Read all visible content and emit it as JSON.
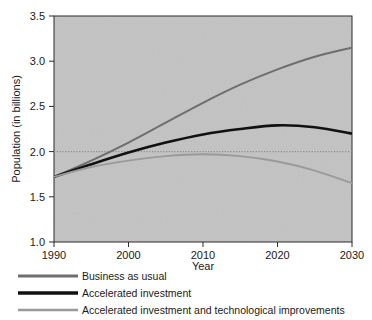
{
  "chart_data": {
    "type": "line",
    "title": "",
    "xlabel": "Year",
    "ylabel": "Population (in billions)",
    "xlim": [
      1990,
      2030
    ],
    "ylim": [
      1.0,
      3.5
    ],
    "xticks": [
      "1990",
      "2000",
      "2010",
      "2020",
      "2030"
    ],
    "xtick_values": [
      1990,
      2000,
      2010,
      2020,
      2030
    ],
    "yticks": [
      "1.0",
      "1.5",
      "2.0",
      "2.5",
      "3.0",
      "3.5"
    ],
    "ytick_values": [
      1.0,
      1.5,
      2.0,
      2.5,
      3.0,
      3.5
    ],
    "grid": false,
    "gridlines": [
      {
        "axis": "y",
        "value": 2.0,
        "style": "dotted"
      }
    ],
    "legend_position": "below",
    "plot_bgcolor": "#c3c3c3",
    "x": [
      1990,
      1995,
      2000,
      2005,
      2010,
      2015,
      2020,
      2025,
      2030
    ],
    "series": [
      {
        "name": "Business as usual",
        "color": "#6e6e6e",
        "width": 2.0,
        "values": [
          1.72,
          1.9,
          2.1,
          2.32,
          2.54,
          2.74,
          2.91,
          3.05,
          3.15
        ]
      },
      {
        "name": "Accelerated investment",
        "color": "#111111",
        "width": 2.6,
        "values": [
          1.72,
          1.86,
          1.99,
          2.1,
          2.19,
          2.25,
          2.29,
          2.27,
          2.2
        ]
      },
      {
        "name": "Accelerated investment and technological improvements",
        "color": "#9a9a9a",
        "width": 1.9,
        "values": [
          1.72,
          1.83,
          1.9,
          1.95,
          1.97,
          1.95,
          1.89,
          1.79,
          1.65
        ]
      }
    ]
  },
  "legend": {
    "items": [
      {
        "label": "Business as usual"
      },
      {
        "label": "Accelerated investment"
      },
      {
        "label": "Accelerated investment and technological improvements"
      }
    ]
  }
}
